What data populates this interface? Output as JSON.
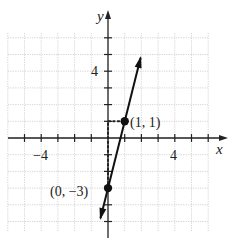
{
  "chart_data": {
    "type": "line",
    "title": "",
    "xlabel": "x",
    "ylabel": "y",
    "xlim": [
      -6,
      6
    ],
    "ylim": [
      -6,
      6
    ],
    "grid": true,
    "x_tick_labels": [
      {
        "value": -4,
        "label": "−4"
      },
      {
        "value": 4,
        "label": "4"
      }
    ],
    "y_tick_labels": [
      {
        "value": 4,
        "label": "4"
      }
    ],
    "series": [
      {
        "name": "line",
        "equation": "y = 4x - 3",
        "slope": 4,
        "intercept": -3,
        "x": [
          -0.5,
          0,
          1,
          2
        ],
        "y": [
          -5,
          -3,
          1,
          5
        ],
        "arrows": "both"
      }
    ],
    "points": [
      {
        "x": 0,
        "y": -3,
        "label": "(0, −3)"
      },
      {
        "x": 1,
        "y": 1,
        "label": "(1, 1)"
      }
    ],
    "annotations": [
      {
        "type": "dotted-path",
        "description": "rise 4 from (0,-3) to (0,1), run 1 to (1,1)"
      }
    ]
  },
  "labels": {
    "x_axis": "x",
    "y_axis": "y",
    "tick_neg4": "−4",
    "tick_x4": "4",
    "tick_y4": "4",
    "point_a": "(0, −3)",
    "point_b": "(1, 1)"
  }
}
